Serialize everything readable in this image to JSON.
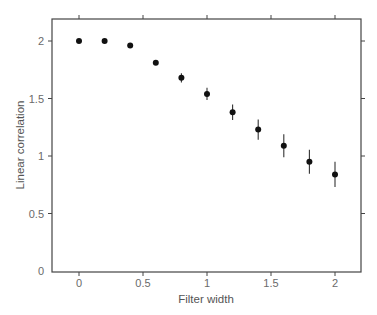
{
  "chart_data": {
    "type": "scatter",
    "title": "",
    "xlabel": "Filter width",
    "ylabel": "Linear correlation",
    "xlim": [
      -0.2,
      2.2
    ],
    "ylim": [
      0,
      2.2
    ],
    "xticks": [
      0,
      0.5,
      1,
      1.5,
      2
    ],
    "xtick_labels": [
      "0",
      "0.5",
      "1",
      "1.5",
      "2"
    ],
    "yticks": [
      0,
      0.5,
      1,
      1.5,
      2
    ],
    "ytick_labels": [
      "0",
      "0.5",
      "1",
      "1.5",
      "2"
    ],
    "grid": false,
    "legend": null,
    "error_bars": true,
    "series": [
      {
        "name": "Linear correlation",
        "x": [
          0,
          0.2,
          0.4,
          0.6,
          0.8,
          1.0,
          1.2,
          1.4,
          1.6,
          1.8,
          2.0
        ],
        "y": [
          2.0,
          2.0,
          1.96,
          1.81,
          1.68,
          1.54,
          1.38,
          1.23,
          1.09,
          0.95,
          0.84
        ],
        "error": [
          0.0,
          0.0,
          0.01,
          0.015,
          0.04,
          0.054,
          0.068,
          0.088,
          0.1,
          0.104,
          0.109
        ]
      }
    ]
  },
  "style": {
    "frame_color": "#444444",
    "marker_color": "#111111",
    "errorbar_color": "#333333",
    "text_color": "#6a6a6a"
  }
}
